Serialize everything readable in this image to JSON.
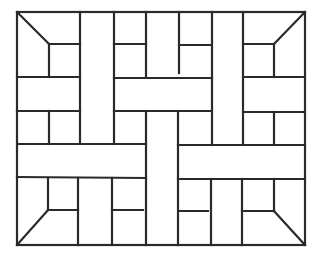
{
  "diagram": {
    "title": "Basket-weave parquet tile pattern",
    "stroke_color": "#2a2a2a",
    "background_color": "#ffffff",
    "stroke_width": 2.2,
    "outer_border": {
      "x1": 17,
      "y1": 12,
      "x2": 305,
      "y2": 245
    },
    "lines": [
      {
        "x1": 17,
        "y1": 12,
        "x2": 49,
        "y2": 44
      },
      {
        "x1": 305,
        "y1": 12,
        "x2": 274,
        "y2": 44
      },
      {
        "x1": 17,
        "y1": 245,
        "x2": 48,
        "y2": 210
      },
      {
        "x1": 305,
        "y1": 245,
        "x2": 274,
        "y2": 211
      },
      {
        "x1": 49,
        "y1": 44,
        "x2": 80,
        "y2": 44
      },
      {
        "x1": 49,
        "y1": 44,
        "x2": 49,
        "y2": 77
      },
      {
        "x1": 243,
        "y1": 44,
        "x2": 274,
        "y2": 44
      },
      {
        "x1": 274,
        "y1": 44,
        "x2": 274,
        "y2": 77
      },
      {
        "x1": 80,
        "y1": 12,
        "x2": 80,
        "y2": 144
      },
      {
        "x1": 114,
        "y1": 12,
        "x2": 114,
        "y2": 144
      },
      {
        "x1": 146,
        "y1": 12,
        "x2": 146,
        "y2": 77
      },
      {
        "x1": 179,
        "y1": 12,
        "x2": 179,
        "y2": 73
      },
      {
        "x1": 212,
        "y1": 12,
        "x2": 212,
        "y2": 145
      },
      {
        "x1": 243,
        "y1": 12,
        "x2": 243,
        "y2": 145
      },
      {
        "x1": 114,
        "y1": 44,
        "x2": 146,
        "y2": 44
      },
      {
        "x1": 179,
        "y1": 45,
        "x2": 210,
        "y2": 45
      },
      {
        "x1": 17,
        "y1": 77,
        "x2": 80,
        "y2": 77
      },
      {
        "x1": 114,
        "y1": 78,
        "x2": 212,
        "y2": 78
      },
      {
        "x1": 243,
        "y1": 77,
        "x2": 305,
        "y2": 77
      },
      {
        "x1": 17,
        "y1": 111,
        "x2": 80,
        "y2": 111
      },
      {
        "x1": 114,
        "y1": 111,
        "x2": 210,
        "y2": 111
      },
      {
        "x1": 243,
        "y1": 112,
        "x2": 305,
        "y2": 112
      },
      {
        "x1": 49,
        "y1": 111,
        "x2": 49,
        "y2": 144
      },
      {
        "x1": 274,
        "y1": 112,
        "x2": 274,
        "y2": 145
      },
      {
        "x1": 146,
        "y1": 111,
        "x2": 146,
        "y2": 245
      },
      {
        "x1": 178,
        "y1": 111,
        "x2": 178,
        "y2": 245
      },
      {
        "x1": 17,
        "y1": 144,
        "x2": 146,
        "y2": 144
      },
      {
        "x1": 178,
        "y1": 145,
        "x2": 305,
        "y2": 145
      },
      {
        "x1": 17,
        "y1": 177,
        "x2": 146,
        "y2": 178
      },
      {
        "x1": 178,
        "y1": 179,
        "x2": 305,
        "y2": 179
      },
      {
        "x1": 48,
        "y1": 178,
        "x2": 48,
        "y2": 210
      },
      {
        "x1": 48,
        "y1": 210,
        "x2": 78,
        "y2": 210
      },
      {
        "x1": 78,
        "y1": 178,
        "x2": 78,
        "y2": 245
      },
      {
        "x1": 112,
        "y1": 178,
        "x2": 112,
        "y2": 245
      },
      {
        "x1": 112,
        "y1": 210,
        "x2": 143,
        "y2": 210
      },
      {
        "x1": 179,
        "y1": 211,
        "x2": 208,
        "y2": 211
      },
      {
        "x1": 211,
        "y1": 179,
        "x2": 211,
        "y2": 245
      },
      {
        "x1": 242,
        "y1": 179,
        "x2": 242,
        "y2": 245
      },
      {
        "x1": 242,
        "y1": 211,
        "x2": 274,
        "y2": 211
      },
      {
        "x1": 274,
        "y1": 179,
        "x2": 274,
        "y2": 211
      },
      {
        "x1": 49,
        "y1": 12,
        "x2": 49,
        "y2": 12
      }
    ]
  }
}
